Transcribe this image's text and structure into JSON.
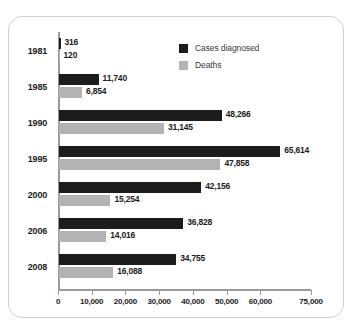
{
  "chart_data": {
    "type": "bar",
    "orientation": "horizontal",
    "title": "",
    "xlabel": "",
    "ylabel": "",
    "categories": [
      "1981",
      "1985",
      "1990",
      "1995",
      "2000",
      "2006",
      "2008"
    ],
    "series": [
      {
        "name": "Cases diagnosed",
        "color": "#1c1c1c",
        "values": [
          316,
          11740,
          48266,
          65614,
          42156,
          36828,
          34755
        ],
        "labels": [
          "316",
          "11,740",
          "48,266",
          "65,614",
          "42,156",
          "36,828",
          "34,755"
        ]
      },
      {
        "name": "Deaths",
        "color": "#b3b3b3",
        "values": [
          120,
          6854,
          31145,
          47858,
          15254,
          14016,
          16088
        ],
        "labels": [
          "120",
          "6,854",
          "31,145",
          "47,858",
          "15,254",
          "14,016",
          "16,088"
        ]
      }
    ],
    "xlim": [
      0,
      75000
    ],
    "xticks": [
      0,
      10000,
      20000,
      30000,
      40000,
      50000,
      60000,
      75000
    ],
    "xtick_labels": [
      "0",
      "10,000",
      "20,000",
      "30,000",
      "40,000",
      "50,000",
      "60,000",
      "75,000"
    ],
    "grid": false,
    "legend_position": "top-right"
  },
  "legend": {
    "items": [
      {
        "label": "Cases diagnosed",
        "swatch": "cases"
      },
      {
        "label": "Deaths",
        "swatch": "deaths"
      }
    ]
  }
}
